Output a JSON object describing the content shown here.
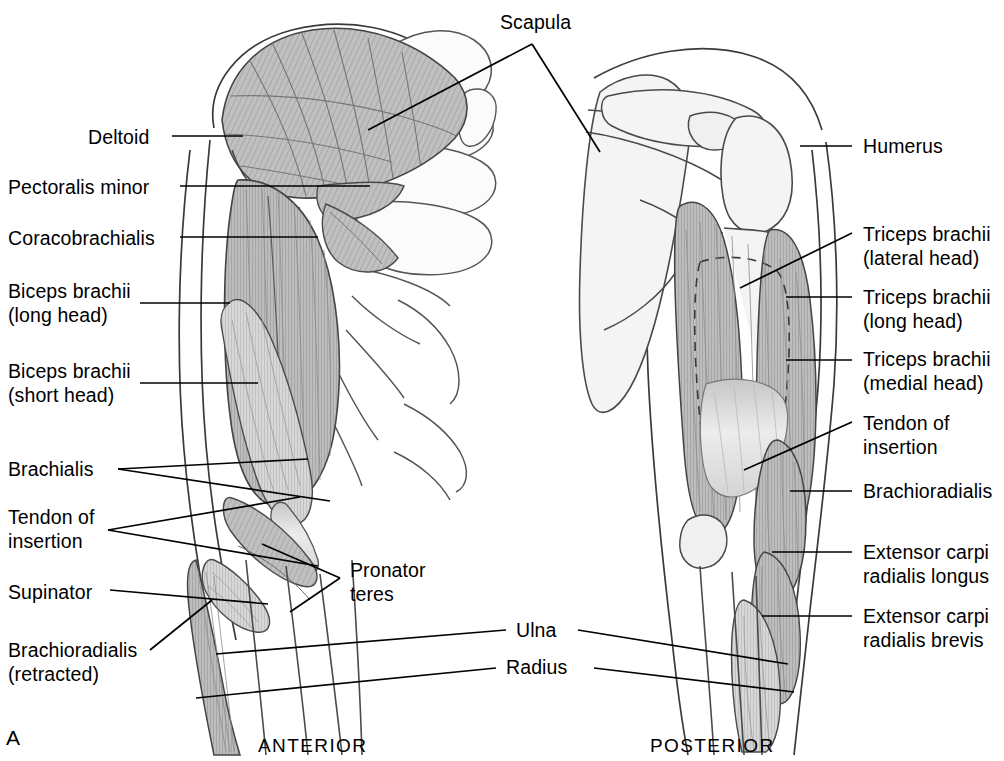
{
  "figure": {
    "panel_letter": "A",
    "background_color": "#ffffff",
    "ink_color": "#000000",
    "muscle_fill_color": "#b9b9b9",
    "bone_fill_color": "#f2f2f2",
    "width": 1004,
    "height": 761
  },
  "captions": [
    {
      "text": "ANTERIOR",
      "x": 258,
      "y": 735
    },
    {
      "text": "POSTERIOR",
      "x": 650,
      "y": 735
    }
  ],
  "labels_left": [
    {
      "name": "deltoid",
      "lines": [
        "Deltoid"
      ],
      "x": 88,
      "y": 125
    },
    {
      "name": "pectoralis-minor",
      "lines": [
        "Pectoralis minor"
      ],
      "x": 8,
      "y": 175
    },
    {
      "name": "coracobrachialis",
      "lines": [
        "Coracobrachialis"
      ],
      "x": 8,
      "y": 226
    },
    {
      "name": "biceps-brachii-long",
      "lines": [
        "Biceps brachii",
        "(long head)"
      ],
      "x": 8,
      "y": 279
    },
    {
      "name": "biceps-brachii-short",
      "lines": [
        "Biceps brachii",
        "(short head)"
      ],
      "x": 8,
      "y": 359
    },
    {
      "name": "brachialis",
      "lines": [
        "Brachialis"
      ],
      "x": 8,
      "y": 457
    },
    {
      "name": "tendon-of-insertion",
      "lines": [
        "Tendon of",
        "insertion"
      ],
      "x": 8,
      "y": 505
    },
    {
      "name": "supinator",
      "lines": [
        "Supinator"
      ],
      "x": 8,
      "y": 580
    },
    {
      "name": "brachioradialis-retracted",
      "lines": [
        "Brachioradialis",
        "(retracted)"
      ],
      "x": 8,
      "y": 638
    }
  ],
  "labels_right": [
    {
      "name": "humerus",
      "lines": [
        "Humerus"
      ],
      "x": 863,
      "y": 134
    },
    {
      "name": "triceps-brachii-lateral",
      "lines": [
        "Triceps brachii",
        "(lateral head)"
      ],
      "x": 863,
      "y": 222
    },
    {
      "name": "triceps-brachii-long",
      "lines": [
        "Triceps brachii",
        "(long head)"
      ],
      "x": 863,
      "y": 285
    },
    {
      "name": "triceps-brachii-medial",
      "lines": [
        "Triceps brachii",
        "(medial head)"
      ],
      "x": 863,
      "y": 347
    },
    {
      "name": "tendon-of-insertion",
      "lines": [
        "Tendon of",
        "insertion"
      ],
      "x": 863,
      "y": 411
    },
    {
      "name": "brachioradialis",
      "lines": [
        "Brachioradialis"
      ],
      "x": 863,
      "y": 479
    },
    {
      "name": "extensor-carpi-radialis-longus",
      "lines": [
        "Extensor carpi",
        "radialis longus"
      ],
      "x": 863,
      "y": 540
    },
    {
      "name": "extensor-carpi-radialis-brevis",
      "lines": [
        "Extensor carpi",
        "radialis brevis"
      ],
      "x": 863,
      "y": 604
    }
  ],
  "labels_center": [
    {
      "name": "scapula",
      "lines": [
        "Scapula"
      ],
      "x": 500,
      "y": 10
    },
    {
      "name": "pronator-teres",
      "lines": [
        "Pronator",
        "teres"
      ],
      "x": 350,
      "y": 558
    },
    {
      "name": "ulna",
      "lines": [
        "Ulna"
      ],
      "x": 516,
      "y": 618
    },
    {
      "name": "radius",
      "lines": [
        "Radius"
      ],
      "x": 506,
      "y": 655
    }
  ]
}
